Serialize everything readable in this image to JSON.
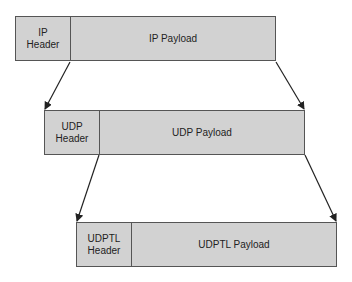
{
  "diagram": {
    "title": "",
    "layers": [
      {
        "id": "ip",
        "header_label": "IP\nHeader",
        "payload_label": "IP Payload"
      },
      {
        "id": "udp",
        "header_label": "UDP\nHeader",
        "payload_label": "UDP Payload"
      },
      {
        "id": "udptl",
        "header_label": "UDPTL\nHeader",
        "payload_label": "UDPTL Payload"
      }
    ],
    "connections": [
      {
        "from": "ip-payload",
        "to": "udp-packet"
      },
      {
        "from": "udp-payload",
        "to": "udptl-packet"
      }
    ],
    "colors": {
      "box_fill": "#d2d2d2",
      "box_border": "#555555",
      "arrow": "#222222",
      "text": "#222222"
    }
  }
}
